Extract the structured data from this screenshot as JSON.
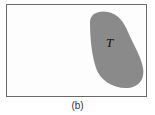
{
  "figure": {
    "region_label": "T",
    "caption": "(b)",
    "colors": {
      "region_fill": "#8a8a8a",
      "border": "#6a6a6a",
      "background": "#ffffff"
    }
  }
}
